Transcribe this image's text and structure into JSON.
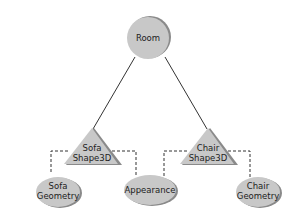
{
  "diagram": {
    "type": "scene-graph",
    "nodes": {
      "room": {
        "label": "Room",
        "shape": "circle"
      },
      "sofa_shape": {
        "line1": "Sofa",
        "line2": "Shape3D",
        "shape": "triangle"
      },
      "chair_shape": {
        "line1": "Chair",
        "line2": "Shape3D",
        "shape": "triangle"
      },
      "sofa_geometry": {
        "line1": "Sofa",
        "line2": "Geometry",
        "shape": "ellipse"
      },
      "appearance": {
        "label": "Appearance",
        "shape": "ellipse"
      },
      "chair_geometry": {
        "line1": "Chair",
        "line2": "Geometry",
        "shape": "ellipse"
      }
    },
    "edges": [
      {
        "from": "Room",
        "to": "Sofa Shape3D",
        "style": "solid"
      },
      {
        "from": "Room",
        "to": "Chair Shape3D",
        "style": "solid"
      },
      {
        "from": "Sofa Shape3D",
        "to": "Sofa Geometry",
        "style": "dashed"
      },
      {
        "from": "Sofa Shape3D",
        "to": "Appearance",
        "style": "dashed"
      },
      {
        "from": "Chair Shape3D",
        "to": "Appearance",
        "style": "dashed"
      },
      {
        "from": "Chair Shape3D",
        "to": "Chair Geometry",
        "style": "dashed"
      }
    ],
    "colors": {
      "fill": "#c8c8c8",
      "shadow": "#8a8a8a",
      "line": "#333333"
    }
  }
}
